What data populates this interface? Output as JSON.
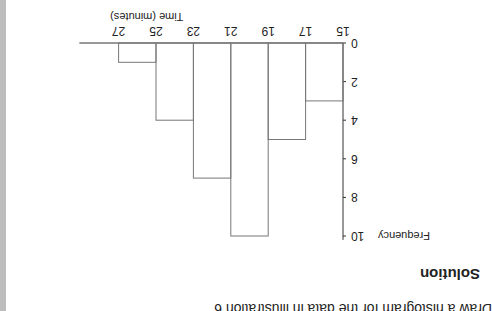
{
  "page": {
    "instruction": "Draw a histogram for the data in illustration 6",
    "solution_heading": "Solution",
    "orientation": "rotated 180 degrees"
  },
  "chart_data": {
    "type": "bar",
    "title": "",
    "xlabel": "Time (minutes)",
    "ylabel": "Frequency",
    "bins": [
      [
        15,
        17
      ],
      [
        17,
        19
      ],
      [
        19,
        21
      ],
      [
        21,
        23
      ],
      [
        23,
        25
      ],
      [
        25,
        27
      ]
    ],
    "categories": [
      "15-17",
      "17-19",
      "19-21",
      "21-23",
      "23-25",
      "25-27"
    ],
    "values": [
      3,
      5,
      10,
      7,
      4,
      1
    ],
    "x_ticks": [
      15,
      17,
      19,
      21,
      23,
      25,
      27
    ],
    "y_ticks": [
      0,
      2,
      4,
      6,
      8,
      10
    ],
    "xlim": [
      15,
      29
    ],
    "ylim": [
      0,
      10
    ],
    "grid": false,
    "legend": null,
    "colors": {
      "line": "#777777",
      "axis": "#333333"
    }
  }
}
